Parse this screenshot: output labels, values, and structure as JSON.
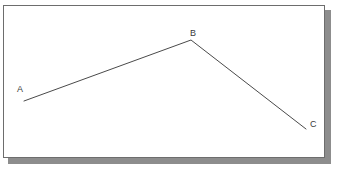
{
  "figure": {
    "title": "",
    "type": "line-diagram",
    "background_color": "#ffffff",
    "panel_color": "#ffffff",
    "panel_border_color": "#6d6d6d",
    "shadow_color": "#8d8d8d",
    "stroke_color": "#4a4a4a",
    "stroke_width": 1,
    "vertices": [
      {
        "id": "A",
        "label": "A",
        "x": 24,
        "y": 101,
        "label_x": 17,
        "label_y": 85
      },
      {
        "id": "B",
        "label": "B",
        "x": 191,
        "y": 40,
        "label_x": 190,
        "label_y": 29
      },
      {
        "id": "C",
        "label": "C",
        "x": 306,
        "y": 129,
        "label_x": 310,
        "label_y": 120
      }
    ],
    "segments": [
      {
        "id": "AB",
        "from": "A",
        "to": "B"
      },
      {
        "id": "BC",
        "from": "B",
        "to": "C"
      }
    ],
    "polyline_points": "24,101 191,40 306,129",
    "panel": {
      "x": 3,
      "y": 5,
      "width": 322,
      "height": 153
    },
    "shadow": {
      "x": 8,
      "y": 10,
      "width": 323,
      "height": 154
    }
  }
}
